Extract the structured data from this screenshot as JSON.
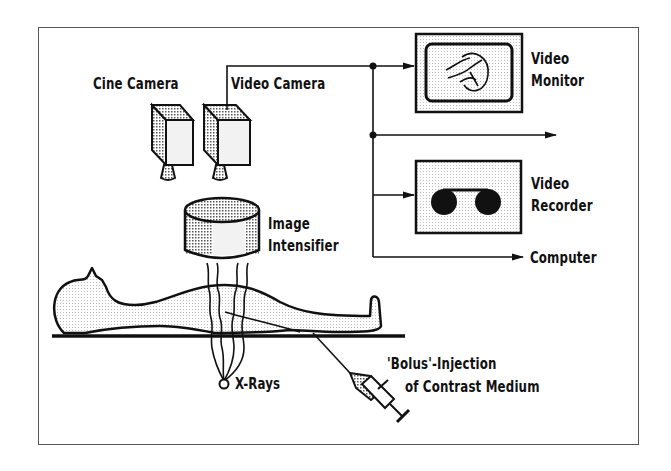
{
  "diagram": {
    "title": "",
    "frame": {
      "x": 38,
      "y": 27,
      "w": 600,
      "h": 417
    },
    "colors": {
      "line": "#111111",
      "shade": "#c8c8c8",
      "light": "#eeeeee",
      "background": "#ffffff"
    },
    "labels": {
      "cine_camera": "Cine Camera",
      "video_camera": "Video Camera",
      "video_monitor_line1": "Video",
      "video_monitor_line2": "Monitor",
      "video_recorder_line1": "Video",
      "video_recorder_line2": "Recorder",
      "computer": "Computer",
      "image_intensifier_line1": "Image",
      "image_intensifier_line2": "Intensifier",
      "x_rays": "X-Rays",
      "bolus_line1": "'Bolus'-Injection",
      "bolus_line2": "of Contrast Medium"
    },
    "nodes": [
      {
        "id": "cine-camera",
        "label": "Cine Camera"
      },
      {
        "id": "video-camera",
        "label": "Video Camera"
      },
      {
        "id": "image-intensifier",
        "label": "Image Intensifier"
      },
      {
        "id": "video-monitor",
        "label": "Video Monitor"
      },
      {
        "id": "video-recorder",
        "label": "Video Recorder"
      },
      {
        "id": "computer",
        "label": "Computer"
      },
      {
        "id": "patient",
        "label": ""
      },
      {
        "id": "x-ray-source",
        "label": "X-Rays"
      },
      {
        "id": "syringe",
        "label": "'Bolus'-Injection of Contrast Medium"
      }
    ],
    "edges": [
      {
        "from": "video-camera",
        "to": "video-monitor"
      },
      {
        "from": "video-camera",
        "to": "unlabeled-output"
      },
      {
        "from": "video-camera",
        "to": "video-recorder"
      },
      {
        "from": "video-camera",
        "to": "computer"
      },
      {
        "from": "x-ray-source",
        "to": "image-intensifier"
      },
      {
        "from": "syringe",
        "to": "patient"
      }
    ]
  }
}
